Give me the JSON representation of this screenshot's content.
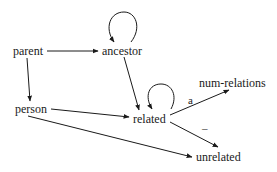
{
  "diagram": {
    "type": "directed-graph",
    "nodes": {
      "parent": "parent",
      "ancestor": "ancestor",
      "person": "person",
      "related": "related",
      "num_relations": "num-relations",
      "unrelated": "unrelated"
    },
    "edges": [
      {
        "from": "parent",
        "to": "ancestor",
        "label": ""
      },
      {
        "from": "parent",
        "to": "person",
        "label": ""
      },
      {
        "from": "ancestor",
        "to": "ancestor",
        "label": ""
      },
      {
        "from": "ancestor",
        "to": "related",
        "label": ""
      },
      {
        "from": "person",
        "to": "related",
        "label": ""
      },
      {
        "from": "person",
        "to": "unrelated",
        "label": ""
      },
      {
        "from": "related",
        "to": "related",
        "label": ""
      },
      {
        "from": "related",
        "to": "num-relations",
        "label": "a"
      },
      {
        "from": "related",
        "to": "unrelated",
        "label": "–"
      }
    ],
    "edge_labels": {
      "related_to_num_relations": "a",
      "related_to_unrelated": "–"
    }
  }
}
